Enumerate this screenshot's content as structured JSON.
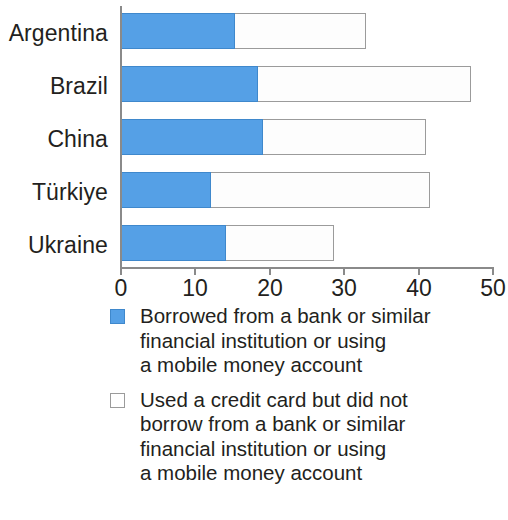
{
  "chart_data": {
    "type": "bar",
    "orientation": "horizontal",
    "stacked": true,
    "title": "",
    "subtitle": "",
    "xlabel": "",
    "ylabel": "",
    "xlim": [
      0,
      50
    ],
    "xticks": [
      0,
      10,
      20,
      30,
      40,
      50
    ],
    "xtick_labels": [
      "0",
      "10",
      "20",
      "30",
      "40",
      "50"
    ],
    "grid": false,
    "legend_position": "bottom-left",
    "categories": [
      "Argentina",
      "Brazil",
      "China",
      "Türkiye",
      "Ukraine"
    ],
    "series": [
      {
        "name": "Borrowed from a bank or similar financial institution or using a mobile money account",
        "color": "#55a0e6",
        "values": [
          15.3,
          18.4,
          19.0,
          12.0,
          14.1
        ]
      },
      {
        "name": "Used a credit card but did not borrow from a bank or similar financial institution or using a mobile money account",
        "color": "#ffffff",
        "values": [
          17.6,
          28.5,
          21.9,
          29.4,
          14.4
        ]
      }
    ],
    "totals": [
      32.9,
      46.9,
      40.9,
      41.4,
      28.5
    ]
  },
  "axis": {
    "ticks": [
      {
        "value": "0"
      },
      {
        "value": "10"
      },
      {
        "value": "20"
      },
      {
        "value": "30"
      },
      {
        "value": "40"
      },
      {
        "value": "50"
      }
    ]
  },
  "categories": [
    {
      "label": "Argentina"
    },
    {
      "label": "Brazil"
    },
    {
      "label": "China"
    },
    {
      "label": "Türkiye"
    },
    {
      "label": "Ukraine"
    }
  ],
  "legend": {
    "items": [
      {
        "swatch": "blue-filled-square",
        "text": "Borrowed from a bank or similar\nfinancial institution or using\na mobile money account"
      },
      {
        "swatch": "white-outlined-square",
        "text": "Used a credit card but did not\nborrow from a bank or similar\nfinancial institution or using\na mobile money account"
      }
    ]
  },
  "colors": {
    "series_blue": "#55a0e6",
    "series_blue_border": "#3f88cc",
    "series_white": "#fdfdfd",
    "series_white_border": "#9b9b9b",
    "axis": "#8a8a8a",
    "text": "#231f20"
  }
}
